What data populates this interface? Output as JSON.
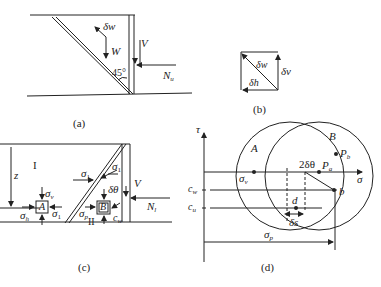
{
  "panels": {
    "a": {
      "caption": "(a)",
      "labels": {
        "dw": "δw",
        "W": "W",
        "angle": "45°",
        "V": "V",
        "N": "N",
        "N_sub": "u"
      }
    },
    "b": {
      "caption": "(b)",
      "labels": {
        "dw": "δw",
        "dv": "δv",
        "dh": "δh"
      }
    },
    "c": {
      "caption": "(c)",
      "labels": {
        "region1": "I",
        "region2": "II",
        "z": "z",
        "sigma": "σ",
        "v": "v",
        "h": "h",
        "one": "1",
        "p": "p",
        "A": "A",
        "B": "B",
        "dtheta": "δθ",
        "V": "V",
        "N": "N",
        "N_sub": "l",
        "c": "c",
        "w": "w"
      }
    },
    "d": {
      "caption": "(d)",
      "labels": {
        "tau": "τ",
        "sigma": "σ",
        "A": "A",
        "B": "B",
        "sigma_v": "σ",
        "v": "v",
        "two_dtheta": "2δθ",
        "P": "P",
        "a": "a",
        "b_sub": "b",
        "b": "b",
        "d": "d",
        "ds": "δs",
        "c": "c",
        "w": "w",
        "u": "u",
        "sigma_p": "σ",
        "p": "p"
      }
    }
  }
}
